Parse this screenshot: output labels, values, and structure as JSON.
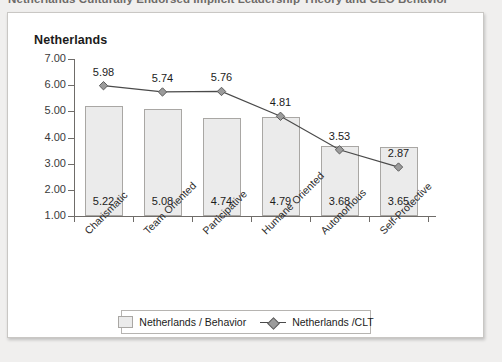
{
  "page": {
    "title": "Netherlands Culturally Endorsed Implicit Leadership Theory and CEO Behavior"
  },
  "chart_heading": "Netherlands",
  "legend": {
    "position": "bottom",
    "items": [
      {
        "label": "Netherlands / Behavior",
        "type": "bar"
      },
      {
        "label": "Netherlands /CLT",
        "type": "line"
      }
    ]
  },
  "chart_data": {
    "type": "bar",
    "title": "Netherlands",
    "xlabel": "",
    "ylabel": "",
    "ylim": [
      1.0,
      7.0
    ],
    "ytick_labels": [
      "7.00",
      "6.00",
      "5.00",
      "4.00",
      "3.00",
      "2.00",
      "1.00"
    ],
    "yticks": [
      7,
      6,
      5,
      4,
      3,
      2,
      1
    ],
    "grid": false,
    "legend_position": "bottom",
    "categories": [
      "Charismatic",
      "Team Oriented",
      "Participative",
      "Humane Oriented",
      "Autonomous",
      "Self-Protective"
    ],
    "series": [
      {
        "name": "Netherlands / Behavior",
        "type": "bar",
        "values": [
          5.22,
          5.08,
          4.74,
          4.79,
          3.68,
          3.65
        ],
        "labels": [
          "5.22",
          "5.08",
          "4.74",
          "4.79",
          "3.68",
          "3.65"
        ]
      },
      {
        "name": "Netherlands /CLT",
        "type": "line",
        "values": [
          5.98,
          5.74,
          5.76,
          4.81,
          3.53,
          2.87
        ],
        "labels": [
          "5.98",
          "5.74",
          "5.76",
          "4.81",
          "3.53",
          "2.87"
        ]
      }
    ],
    "colors": {
      "bar_fill": "#ebebeb",
      "bar_border": "#a9a7a4",
      "line": "#4a4a4a",
      "marker_fill": "#9b9b9b",
      "marker_border": "#5e5e5e",
      "axis": "#6f6c69"
    }
  }
}
